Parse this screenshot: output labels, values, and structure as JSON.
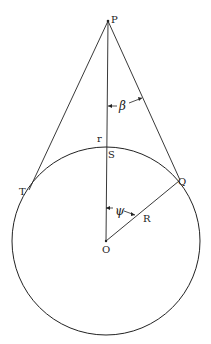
{
  "diagram": {
    "labels": {
      "P": "P",
      "r": "r",
      "S": "S",
      "T": "T",
      "Q": "Q",
      "O": "O",
      "R": "R",
      "beta": "β",
      "psi": "ψ"
    },
    "colors": {
      "stroke": "#222222",
      "background": "#ffffff"
    }
  }
}
